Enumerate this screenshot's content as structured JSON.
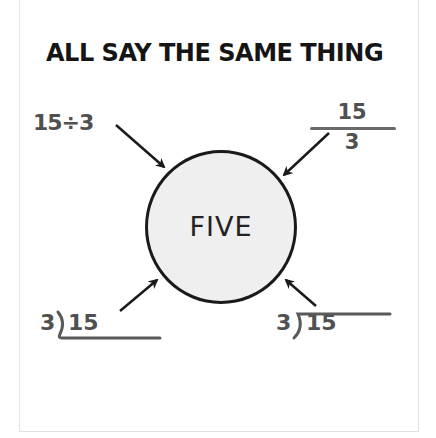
{
  "title": "ALL SAY THE SAME THING",
  "center": {
    "label": "FIVE",
    "fill": "#efefef",
    "stroke": "#1a1a1a"
  },
  "expressions": [
    {
      "position": "top-left",
      "type": "division-sign",
      "text": "15÷3"
    },
    {
      "position": "top-right",
      "type": "fraction",
      "numerator": "15",
      "denominator": "3"
    },
    {
      "position": "bottom-left",
      "type": "long-division-bracket-below",
      "divisor": "3",
      "dividend": "15"
    },
    {
      "position": "bottom-right",
      "type": "long-division-bracket-above",
      "divisor": "3",
      "dividend": "15"
    }
  ],
  "arrows": [
    {
      "from": "top-left",
      "to": "center"
    },
    {
      "from": "top-right",
      "to": "center"
    },
    {
      "from": "bottom-left",
      "to": "center"
    },
    {
      "from": "bottom-right",
      "to": "center"
    }
  ],
  "colors": {
    "title": "#151515",
    "expression_text": "#505050",
    "arrow": "#1a1a1a",
    "frame": "#e2e2e2"
  }
}
